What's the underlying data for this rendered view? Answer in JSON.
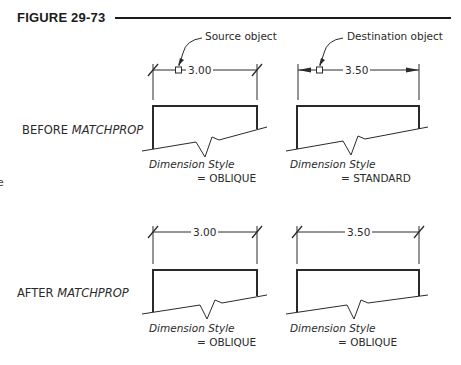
{
  "figure": {
    "title": "FIGURE 29-73"
  },
  "callouts": {
    "source": "Source object",
    "destination": "Destination object"
  },
  "stages": {
    "before": {
      "prefix": "BEFORE ",
      "command": "MATCHPROP"
    },
    "after": {
      "prefix": "AFTER ",
      "command": "MATCHPROP"
    }
  },
  "panels": [
    {
      "id": "before-source",
      "dimension": "3.00",
      "style_label": "Dimension Style",
      "style_value": "= OBLIQUE",
      "arrow_type": "oblique"
    },
    {
      "id": "before-destination",
      "dimension": "3.50",
      "style_label": "Dimension Style",
      "style_value": "= STANDARD",
      "arrow_type": "closed-filled"
    },
    {
      "id": "after-source",
      "dimension": "3.00",
      "style_label": "Dimension Style",
      "style_value": "= OBLIQUE",
      "arrow_type": "oblique"
    },
    {
      "id": "after-destination",
      "dimension": "3.50",
      "style_label": "Dimension Style",
      "style_value": "= OBLIQUE",
      "arrow_type": "oblique"
    }
  ],
  "edge_fragment": "e",
  "colors": {
    "ink": "#1a1a1a",
    "background": "#ffffff"
  }
}
